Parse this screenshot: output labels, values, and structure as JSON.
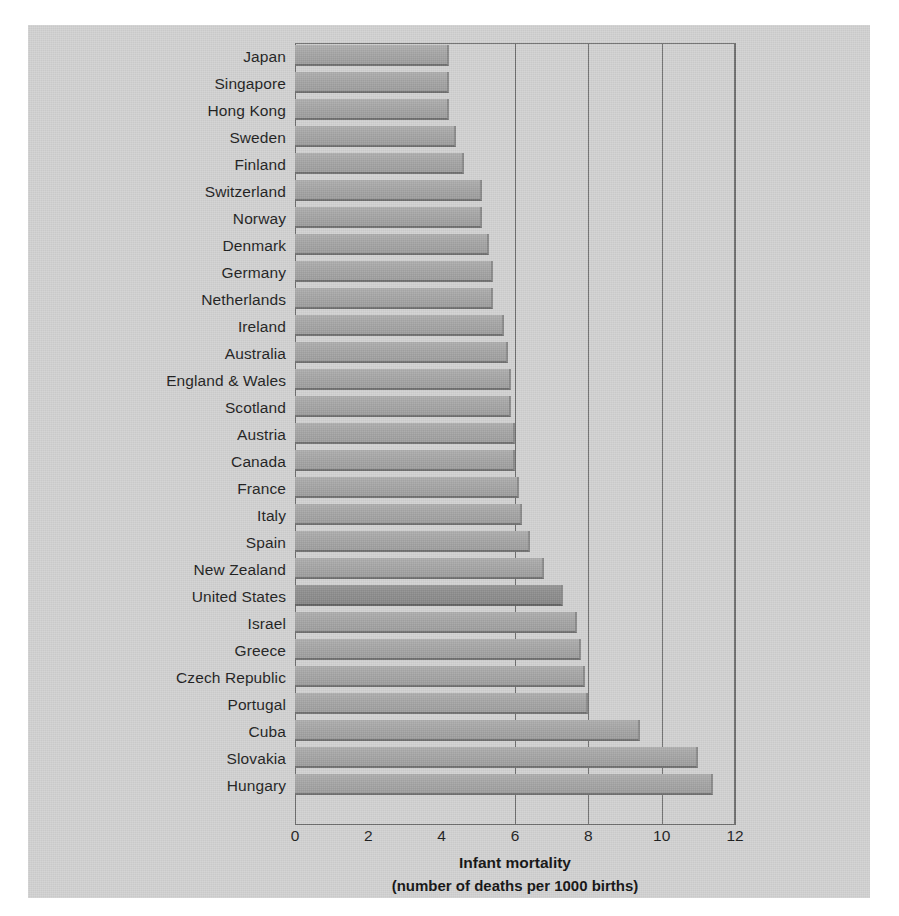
{
  "chart_data": {
    "type": "bar",
    "orientation": "horizontal",
    "title": "",
    "xlabel_line1": "Infant mortality",
    "xlabel_line2": "(number of deaths per 1000 births)",
    "ylabel": "",
    "xlim": [
      0,
      12
    ],
    "xticks": [
      "0",
      "2",
      "4",
      "6",
      "8",
      "10",
      "12"
    ],
    "xtick_values": [
      0,
      2,
      4,
      6,
      8,
      10,
      12
    ],
    "grid": "vertical gridlines at 6, 8, 10, 12",
    "legend": "none",
    "highlight_category": "United States",
    "categories": [
      "Japan",
      "Singapore",
      "Hong Kong",
      "Sweden",
      "Finland",
      "Switzerland",
      "Norway",
      "Denmark",
      "Germany",
      "Netherlands",
      "Ireland",
      "Australia",
      "England & Wales",
      "Scotland",
      "Austria",
      "Canada",
      "France",
      "Italy",
      "Spain",
      "New Zealand",
      "United States",
      "Israel",
      "Greece",
      "Czech Republic",
      "Portugal",
      "Cuba",
      "Slovakia",
      "Hungary"
    ],
    "values": [
      4.2,
      4.2,
      4.2,
      4.4,
      4.6,
      5.1,
      5.1,
      5.3,
      5.4,
      5.4,
      5.7,
      5.8,
      5.9,
      5.9,
      6.0,
      6.0,
      6.1,
      6.2,
      6.4,
      6.8,
      7.3,
      7.7,
      7.8,
      7.9,
      8.0,
      9.4,
      11.0,
      11.4
    ],
    "units": "deaths per 1000 live births",
    "bar_color": "#a5a5a5",
    "highlight_color": "#8d8d8d",
    "background_color": "#d2d2d2",
    "axis_color": "#6d6d6d",
    "text_color": "#1c1c1c"
  }
}
